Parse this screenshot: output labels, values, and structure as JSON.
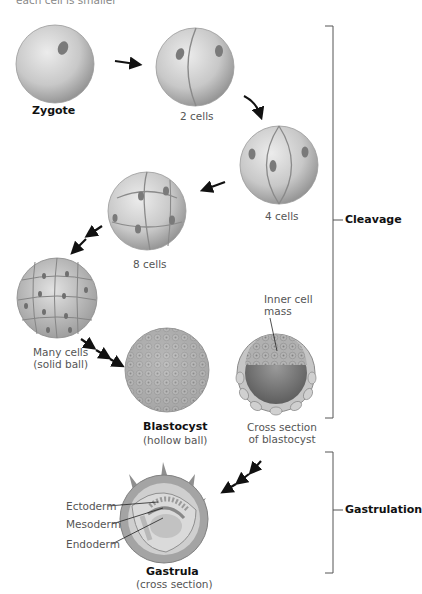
{
  "header": {
    "cut_text": "each cell is smaller"
  },
  "stages": {
    "zygote": {
      "label": "Zygote"
    },
    "two_cells": {
      "label": "2 cells"
    },
    "four_cells": {
      "label": "4 cells"
    },
    "eight_cells": {
      "label": "8 cells"
    },
    "many_cells": {
      "label_line1": "Many cells",
      "label_line2": "(solid ball)"
    },
    "blastocyst": {
      "label": "Blastocyst",
      "sublabel": "(hollow ball)"
    },
    "blastocyst_section": {
      "label_line1": "Cross section",
      "label_line2": "of blastocyst",
      "inner_line1": "Inner cell",
      "inner_line2": "mass"
    },
    "gastrula": {
      "label": "Gastrula",
      "sublabel": "(cross section)",
      "layers": [
        "Ectoderm",
        "Mesoderm",
        "Endoderm"
      ]
    }
  },
  "brackets": {
    "cleavage": "Cleavage",
    "gastrulation": "Gastrulation"
  },
  "colors": {
    "cell_light": "#dcdcdc",
    "cell_dark": "#9a9a9a",
    "nucleus": "#7a7a7a",
    "arrow": "#111111",
    "bracket": "#555555"
  }
}
